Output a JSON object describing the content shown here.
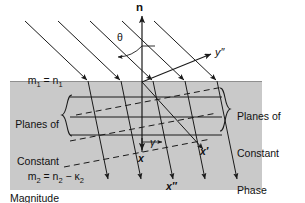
{
  "figure": {
    "type": "optics-ray-diagram",
    "background_color": "#ffffff",
    "medium_fill_color": "#c9c9c9",
    "line_color": "#1a1a1a"
  },
  "labels": {
    "normal": "n",
    "theta": "θ",
    "gamma": "γ",
    "y_double_prime": "y″",
    "x": "x",
    "x_prime": "x′",
    "x_double_prime": "x″",
    "medium1_prefix": "m",
    "medium1_sub": "1",
    "medium1_eq": " = n",
    "medium1_eq_sub": "1",
    "medium2_prefix": "m",
    "medium2_sub": "2",
    "medium2_eq": " = n",
    "medium2_eq_sub": "2",
    "medium2_minus": " − κ",
    "medium2_kappa_sub": "2",
    "planes_magnitude_line1": "Planes of",
    "planes_magnitude_line2": "Constant",
    "planes_magnitude_line3": "Magnitude",
    "planes_phase_line1": "Planes of",
    "planes_phase_line2": "Constant",
    "planes_phase_line3": "Phase"
  },
  "geometry": {
    "interface_y": 81,
    "medium_rect": {
      "x": 10,
      "y": 81,
      "width": 252,
      "height": 109
    },
    "normal_axis": {
      "x": 142,
      "y_top": 13,
      "y_bottom": 152
    },
    "y_axis": {
      "x1": 142,
      "y1": 82,
      "x2": 214,
      "y2": 53
    },
    "incident_rays": [
      {
        "x1": 25,
        "y1": 21,
        "x2": 88,
        "y2": 81
      },
      {
        "x1": 58,
        "y1": 21,
        "x2": 121,
        "y2": 81
      },
      {
        "x1": 90,
        "y1": 21,
        "x2": 153,
        "y2": 81
      },
      {
        "x1": 122,
        "y1": 21,
        "x2": 185,
        "y2": 81
      },
      {
        "x1": 154,
        "y1": 21,
        "x2": 217,
        "y2": 81
      }
    ],
    "refracted_rays": [
      {
        "x1": 88,
        "y1": 81,
        "x2": 108,
        "y2": 182
      },
      {
        "x1": 121,
        "y1": 81,
        "x2": 141,
        "y2": 182
      },
      {
        "x1": 153,
        "y1": 81,
        "x2": 173,
        "y2": 182
      },
      {
        "x1": 185,
        "y1": 81,
        "x2": 205,
        "y2": 182
      },
      {
        "x1": 217,
        "y1": 81,
        "x2": 237,
        "y2": 182
      }
    ],
    "constant_magnitude_lines": [
      {
        "x1": 70,
        "y1": 97,
        "x2": 222,
        "y2": 97
      },
      {
        "x1": 70,
        "y1": 117,
        "x2": 222,
        "y2": 117
      },
      {
        "x1": 70,
        "y1": 135,
        "x2": 222,
        "y2": 135
      }
    ],
    "constant_phase_lines": [
      {
        "x1": 76,
        "y1": 115,
        "x2": 223,
        "y2": 87
      },
      {
        "x1": 70,
        "y1": 141,
        "x2": 217,
        "y2": 113
      },
      {
        "x1": 64,
        "y1": 167,
        "x2": 211,
        "y2": 139
      }
    ],
    "gamma_ray": {
      "x1": 142,
      "y1": 82,
      "x2": 206,
      "y2": 152
    },
    "x_markers": [
      {
        "name": "x",
        "x": 142,
        "y": 152
      },
      {
        "name": "x-prime",
        "x": 206,
        "y": 152
      },
      {
        "name": "x-double-prime",
        "x": 173,
        "y": 182
      }
    ]
  }
}
